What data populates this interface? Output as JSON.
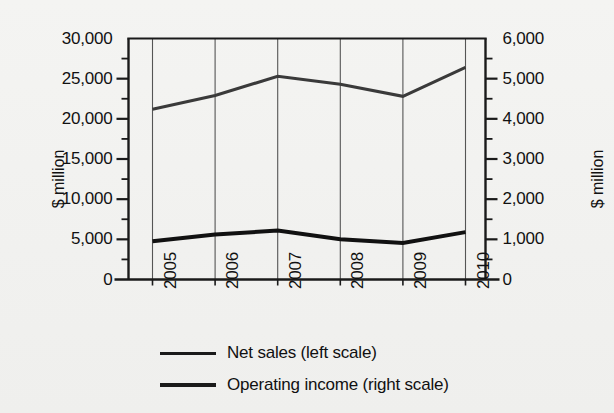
{
  "chart_data": {
    "type": "line",
    "title": "",
    "xlabel": "",
    "ylabel": "$ million",
    "y2label": "$ million",
    "categories": [
      "2005",
      "2006",
      "2007",
      "2008",
      "2009",
      "2010"
    ],
    "series": [
      {
        "name": "Net sales (left scale)",
        "axis": "left",
        "color": "#3a3a3a",
        "stroke_width": 3,
        "values": [
          21200,
          22900,
          25300,
          24300,
          22800,
          26400
        ]
      },
      {
        "name": "Operating income (right scale)",
        "axis": "right",
        "color": "#111111",
        "stroke_width": 4,
        "values": [
          950,
          1120,
          1220,
          1000,
          910,
          1180
        ]
      }
    ],
    "left_axis": {
      "label": "$ million",
      "ylim": [
        0,
        30000
      ],
      "major_ticks": [
        0,
        5000,
        10000,
        15000,
        20000,
        25000,
        30000
      ],
      "minor_ticks": [
        2500,
        7500,
        12500,
        17500,
        22500,
        27500
      ],
      "tick_labels": [
        "0",
        "5,000",
        "10,000",
        "15,000",
        "20,000",
        "25,000",
        "30,000"
      ]
    },
    "right_axis": {
      "label": "$ million",
      "ylim": [
        0,
        6000
      ],
      "major_ticks": [
        0,
        1000,
        2000,
        3000,
        4000,
        5000,
        6000
      ],
      "minor_ticks": [
        500,
        1500,
        2500,
        3500,
        4500,
        5500
      ],
      "tick_labels": [
        "0",
        "1,000",
        "2,000",
        "3,000",
        "4,000",
        "5,000",
        "6,000"
      ]
    },
    "grid": {
      "vertical": true,
      "horizontal": false
    },
    "legend_position": "bottom"
  },
  "legend": {
    "items": [
      {
        "label": "Net sales (left scale)",
        "weight": "thin"
      },
      {
        "label": "Operating income (right scale)",
        "weight": "thick"
      }
    ]
  },
  "colors": {
    "background": "#f2f2f0",
    "axis": "#1a1a1a",
    "grid": "#555555",
    "net_sales": "#3a3a3a",
    "operating_income": "#111111"
  }
}
